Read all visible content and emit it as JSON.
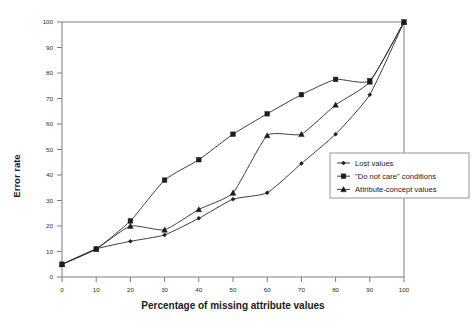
{
  "chart_data": {
    "type": "line",
    "title": "",
    "xlabel": "Percentage of missing attribute values",
    "ylabel": "Error rate",
    "xlim": [
      0,
      100
    ],
    "ylim": [
      0,
      100
    ],
    "grid": false,
    "legend_position": "right-middle",
    "x": [
      0,
      10,
      20,
      30,
      40,
      50,
      60,
      70,
      80,
      90,
      100
    ],
    "xticks": [
      "0",
      "10",
      "20",
      "30",
      "40",
      "50",
      "60",
      "70",
      "80",
      "90",
      "100"
    ],
    "yticks": [
      "0",
      "10",
      "20",
      "30",
      "40",
      "50",
      "60",
      "70",
      "80",
      "90",
      "100"
    ],
    "series": [
      {
        "name": "Lost values",
        "marker": "small-diamond",
        "values": [
          5,
          11,
          14,
          16.5,
          23,
          30.5,
          33,
          44.5,
          56,
          71.5,
          100
        ]
      },
      {
        "name": "\"Do not care\" conditions",
        "marker": "square",
        "values": [
          5,
          11,
          22,
          38,
          46,
          56,
          64,
          71.5,
          77.5,
          77,
          100
        ]
      },
      {
        "name": "Attribute-concept values",
        "marker": "triangle",
        "values": [
          5,
          11,
          20,
          18.5,
          26.5,
          33,
          55.5,
          56,
          67.5,
          76.5,
          100
        ]
      }
    ]
  },
  "legend": {
    "items": [
      {
        "label": "Lost values"
      },
      {
        "label": "\"Do not care\" conditions"
      },
      {
        "label": "Attribute-concept values"
      }
    ]
  },
  "axes": {
    "x_title": "Percentage of missing attribute values",
    "y_title": "Error rate"
  }
}
